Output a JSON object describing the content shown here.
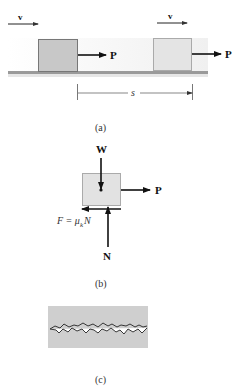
{
  "panels": {
    "a": {
      "caption": "(a)",
      "velocity_label_1": "v",
      "velocity_label_2": "v",
      "force_label_1": "P",
      "force_label_2": "P",
      "displacement_label": "s"
    },
    "b": {
      "caption": "(b)",
      "weight_label": "W",
      "applied_force_label": "P",
      "normal_label": "N",
      "friction_label_prefix": "F = μ",
      "friction_subscript": "k",
      "friction_label_suffix": "N"
    },
    "c": {
      "caption": "(c)"
    }
  },
  "colors": {
    "block_initial": "#c8c8c8",
    "block_final": "#e4e4e4",
    "fbd_block": "#e2e2e2",
    "rough_surface": "#cfcfcf",
    "ink": "#111111"
  }
}
